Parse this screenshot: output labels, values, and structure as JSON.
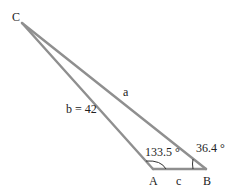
{
  "diagram": {
    "type": "triangle",
    "vertices": {
      "A": {
        "label": "A",
        "x": 153,
        "y": 169
      },
      "B": {
        "label": "B",
        "x": 206,
        "y": 169
      },
      "C": {
        "label": "C",
        "x": 22,
        "y": 23
      }
    },
    "sides": {
      "a": {
        "label": "a"
      },
      "b": {
        "label": "b = 42"
      },
      "c": {
        "label": "c"
      }
    },
    "angles": {
      "A": {
        "label": "133.5 °"
      },
      "B": {
        "label": "36.4 °"
      }
    },
    "colors": {
      "stroke": "#8f8f8f",
      "text": "#222222"
    }
  }
}
